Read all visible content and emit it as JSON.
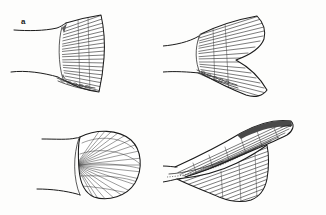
{
  "figure": {
    "background_color": "#fdfdfc",
    "ink_color": "#1b1b1b",
    "width": 326,
    "height": 215,
    "style": "black-and-white line drawing"
  },
  "panels": [
    {
      "label": "a",
      "name": "truncate-caudal-fin",
      "description": "Truncate (squared) caudal fin with straight vertical posterior margin, fin rays radiating from the caudal peduncle, row of scales at fin base"
    },
    {
      "label": "b",
      "name": "forked-caudal-fin",
      "description": "Deeply forked caudal fin with pointed upper and lower lobes and a concave notch between them, fin rays radiating from the caudal peduncle, row of scales at fin base"
    },
    {
      "label": "c",
      "name": "rounded-caudal-fin",
      "description": "Rounded (fan shaped) caudal fin with convex posterior margin and finely spaced fin rays"
    },
    {
      "label": "d",
      "name": "heterocercal-caudal-fin",
      "description": "Heterocercal shark-type caudal fin with an elongated upturned dorsal lobe, smaller ventral lobe and a dashed lateral line on the caudal peduncle"
    }
  ],
  "labels": {
    "a": "a",
    "b": "b",
    "c": "c",
    "d": "d"
  }
}
